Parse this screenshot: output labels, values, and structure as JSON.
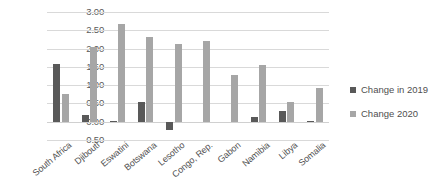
{
  "chart_data": {
    "type": "bar",
    "title": "",
    "subtitle": "",
    "xlabel": "",
    "ylabel": "",
    "ylim": [
      -0.5,
      3.0
    ],
    "yticks": [
      "-0.50",
      "0.00",
      "0.50",
      "1.00",
      "1.50",
      "2.00",
      "2.50",
      "3.00"
    ],
    "ytick_values": [
      -0.5,
      0,
      0.5,
      1.0,
      1.5,
      2.0,
      2.5,
      3.0
    ],
    "grid": true,
    "legend_position": "right",
    "categories": [
      "South Africa",
      "Djibouti",
      "Eswatini",
      "Botswana",
      "Lesotho",
      "Congo, Rep.",
      "Gabon",
      "Namibia",
      "Libya",
      "Somalia"
    ],
    "series": [
      {
        "name": "Change in 2019",
        "color": "#595959",
        "values": [
          1.57,
          0.17,
          0.03,
          0.53,
          -0.22,
          0.0,
          0.0,
          0.13,
          0.28,
          0.02
        ]
      },
      {
        "name": "Change 2020",
        "color": "#a6a6a6",
        "values": [
          0.75,
          2.03,
          2.67,
          2.32,
          2.12,
          2.22,
          1.27,
          1.56,
          0.53,
          0.93
        ]
      }
    ]
  },
  "legend": {
    "items": [
      {
        "label": "Change in 2019",
        "color": "#595959"
      },
      {
        "label": "Change 2020",
        "color": "#a6a6a6"
      }
    ]
  }
}
